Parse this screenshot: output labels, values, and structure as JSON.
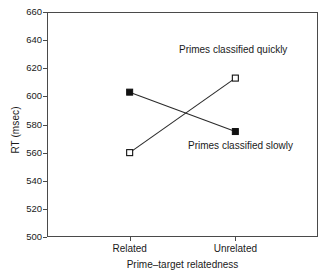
{
  "chart_data": {
    "type": "line",
    "title": "",
    "xlabel": "Prime–target relatedness",
    "ylabel": "RT (msec)",
    "categories": [
      "Related",
      "Unrelated"
    ],
    "ylim": [
      500,
      660
    ],
    "yticks": [
      500,
      520,
      540,
      560,
      580,
      600,
      620,
      640,
      660
    ],
    "ytick_labels": [
      "500",
      "520",
      "540",
      "560",
      "580",
      "600",
      "620",
      "640",
      "660"
    ],
    "grid": false,
    "legend": "none",
    "series": [
      {
        "name": "Primes classified quickly",
        "marker": "open-square",
        "values": [
          560,
          613
        ]
      },
      {
        "name": "Primes classified slowly",
        "marker": "filled-square",
        "values": [
          603,
          575
        ]
      }
    ],
    "annotations": [
      {
        "text": "Primes classified quickly",
        "series": "Primes classified quickly"
      },
      {
        "text": "Primes classified slowly",
        "series": "Primes classified slowly"
      }
    ]
  },
  "colors": {
    "line": "#2b2b2b",
    "axis": "#4a4a4a",
    "text": "#1a1a1a",
    "marker_fill": "#111111",
    "marker_open_fill": "#ffffff",
    "background": "#ffffff"
  }
}
